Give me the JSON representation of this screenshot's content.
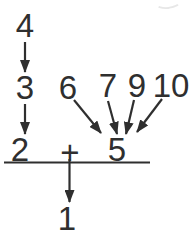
{
  "figure": {
    "background_color": "#ffffff",
    "ink_color": "#2f2f2f",
    "font_size": 33,
    "numbers": [
      {
        "id": "4",
        "label": "4",
        "x": 25,
        "y": 25
      },
      {
        "id": "3",
        "label": "3",
        "x": 25,
        "y": 87
      },
      {
        "id": "2",
        "label": "2",
        "x": 20,
        "y": 149
      },
      {
        "id": "6",
        "label": "6",
        "x": 68,
        "y": 87
      },
      {
        "id": "7",
        "label": "7",
        "x": 108,
        "y": 85
      },
      {
        "id": "9",
        "label": "9",
        "x": 137,
        "y": 85
      },
      {
        "id": "10",
        "label": "10",
        "x": 171,
        "y": 85
      },
      {
        "id": "plus",
        "label": "+",
        "x": 70,
        "y": 152
      },
      {
        "id": "5",
        "label": "5",
        "x": 117,
        "y": 149
      },
      {
        "id": "1",
        "label": "1",
        "x": 67,
        "y": 218
      }
    ],
    "arrows": [
      {
        "from": "4",
        "to": "3",
        "x1": 25,
        "y1": 42,
        "x2": 25,
        "y2": 72
      },
      {
        "from": "3",
        "to": "2",
        "x1": 25,
        "y1": 104,
        "x2": 25,
        "y2": 134
      },
      {
        "from": "6",
        "to": "5",
        "x1": 74,
        "y1": 100,
        "x2": 101,
        "y2": 133
      },
      {
        "from": "7",
        "to": "5",
        "x1": 108,
        "y1": 101,
        "x2": 117,
        "y2": 134
      },
      {
        "from": "9",
        "to": "5",
        "x1": 134,
        "y1": 100,
        "x2": 126,
        "y2": 134
      },
      {
        "from": "10",
        "to": "5",
        "x1": 162,
        "y1": 99,
        "x2": 137,
        "y2": 132
      },
      {
        "from": "plus",
        "to": "1",
        "x1": 69.5,
        "y1": 159,
        "x2": 69.5,
        "y2": 202
      }
    ],
    "sum_line": {
      "x1": 4,
      "x2": 150,
      "y": 162.5,
      "stroke_width": 1.8
    }
  }
}
